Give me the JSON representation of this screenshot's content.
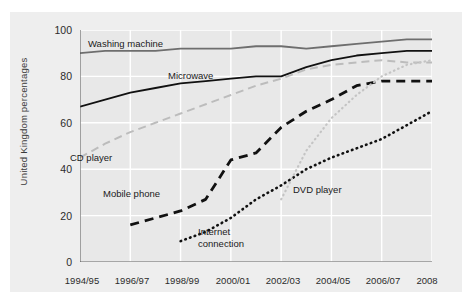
{
  "axes": {
    "ylabel": "United Kingdom percentages",
    "yticks": [
      0,
      20,
      40,
      60,
      80,
      100
    ],
    "xticks": [
      "1994/95",
      "1996/97",
      "1998/99",
      "2000/01",
      "2002/03",
      "2004/05",
      "2006/07",
      "2008"
    ]
  },
  "series_labels": {
    "washing_machine": "Washing machine",
    "microwave": "Microwave",
    "cd_player": "CD player",
    "mobile_phone": "Mobile phone",
    "internet_connection_line1": "Internet",
    "internet_connection_line2": "connection",
    "dvd_player": "DVD player"
  },
  "colors": {
    "panel_background": "#eeeeee",
    "plot_background": "#e8e8e8",
    "gridline": "#ffffff",
    "axis": "#555555",
    "washing_machine": "#6e6e6e",
    "microwave": "#111111",
    "cd_player": "#bcbcbc",
    "mobile_phone": "#111111",
    "internet_connection": "#111111",
    "dvd_player": "#c4c4c4",
    "tick_text": "#2b2b2b"
  },
  "chart_data": {
    "type": "line",
    "title": "",
    "xlabel": "",
    "ylabel": "United Kingdom percentages",
    "ylim": [
      0,
      100
    ],
    "yticks": [
      0,
      20,
      40,
      60,
      80,
      100
    ],
    "grid": true,
    "legend": "inline-labels",
    "x": [
      "1994/95",
      "1995/96",
      "1996/97",
      "1997/98",
      "1998/99",
      "1999/00",
      "2000/01",
      "2001/02",
      "2002/03",
      "2003/04",
      "2004/05",
      "2005/06",
      "2006/07",
      "2007/08",
      "2008"
    ],
    "xticklabels": [
      "1994/95",
      "1996/97",
      "1998/99",
      "2000/01",
      "2002/03",
      "2004/05",
      "2006/07",
      "2008"
    ],
    "series": [
      {
        "name": "Washing machine",
        "style": "solid",
        "color": "#6e6e6e",
        "values": [
          90,
          91,
          91,
          91,
          92,
          92,
          92,
          93,
          93,
          92,
          93,
          94,
          95,
          96,
          96
        ]
      },
      {
        "name": "Microwave",
        "style": "solid",
        "color": "#111111",
        "values": [
          67,
          70,
          73,
          75,
          77,
          78,
          79,
          80,
          80,
          84,
          87,
          89,
          90,
          91,
          91
        ]
      },
      {
        "name": "CD player",
        "style": "dashed",
        "color": "#bcbcbc",
        "values": [
          45,
          51,
          56,
          60,
          64,
          68,
          72,
          76,
          79,
          83,
          85,
          86,
          87,
          86,
          86
        ]
      },
      {
        "name": "Mobile phone",
        "style": "dashed-thick",
        "color": "#111111",
        "values": [
          null,
          null,
          16,
          19,
          22,
          27,
          44,
          47,
          58,
          65,
          70,
          76,
          78,
          78,
          78
        ]
      },
      {
        "name": "Internet connection",
        "style": "dotted",
        "color": "#111111",
        "values": [
          null,
          null,
          null,
          null,
          9,
          13,
          19,
          27,
          33,
          40,
          45,
          49,
          53,
          59,
          65
        ]
      },
      {
        "name": "DVD player",
        "style": "dotted-light",
        "color": "#c4c4c4",
        "values": [
          null,
          null,
          null,
          null,
          null,
          null,
          null,
          null,
          27,
          48,
          62,
          72,
          80,
          85,
          87
        ]
      }
    ]
  }
}
